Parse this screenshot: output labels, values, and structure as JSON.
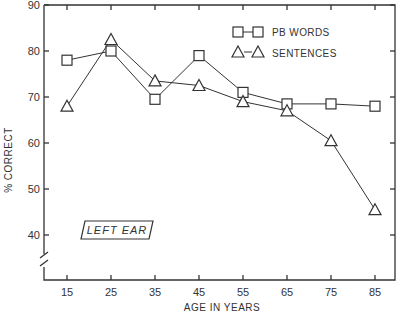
{
  "chart_data": {
    "type": "line",
    "title": "",
    "xlabel": "AGE IN YEARS",
    "ylabel": "% CORRECT",
    "x": [
      15,
      25,
      35,
      45,
      55,
      65,
      75,
      85
    ],
    "x_tick_labels": [
      "15",
      "25",
      "35",
      "45",
      "55",
      "65",
      "75",
      "85"
    ],
    "y_tick_labels": [
      "90",
      "80",
      "70",
      "60",
      "50",
      "40"
    ],
    "ylim": [
      33,
      90
    ],
    "y_axis_break": true,
    "grid": false,
    "legend_position": "upper right",
    "series": [
      {
        "name": "PB WORDS",
        "marker": "square",
        "values": [
          78,
          80,
          69.5,
          79,
          71,
          68.5,
          68.5,
          68
        ]
      },
      {
        "name": "SENTENCES",
        "marker": "triangle",
        "values": [
          68,
          82.5,
          73.5,
          72.5,
          69,
          67,
          60.5,
          45.5
        ]
      }
    ],
    "annotations": [
      "LEFT EAR"
    ]
  },
  "labels": {
    "xlabel": "AGE IN YEARS",
    "ylabel": "% CORRECT",
    "legend_pb": "PB WORDS",
    "legend_sent": "SENTENCES",
    "annotation": "LEFT EAR"
  }
}
